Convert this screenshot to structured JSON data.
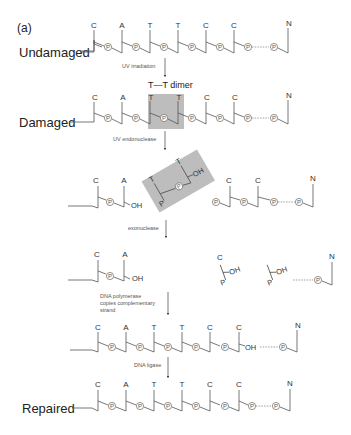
{
  "panel_label": "(a)",
  "rows": {
    "undamaged": {
      "label": "Undamaged",
      "bases": [
        "C",
        "A",
        "T",
        "T",
        "C",
        "C",
        "N"
      ]
    },
    "damaged": {
      "label": "Damaged",
      "bases": [
        "C",
        "A",
        "T",
        "T",
        "C",
        "C",
        "N"
      ],
      "dimer_label": "T—T dimer"
    },
    "incised": {
      "left_bases": [
        "C",
        "A"
      ],
      "excised_bases": [
        "T",
        "T"
      ],
      "right_bases": [
        "C",
        "C",
        "N"
      ]
    },
    "exonuclease": {
      "left_bases": [
        "C",
        "A"
      ],
      "right_bases": [
        "C",
        "N"
      ]
    },
    "polymerase": {
      "bases": [
        "C",
        "A",
        "T",
        "T",
        "C",
        "C",
        "N"
      ]
    },
    "repaired": {
      "label": "Repaired",
      "bases": [
        "C",
        "A",
        "T",
        "T",
        "C",
        "C",
        "N"
      ]
    }
  },
  "steps": {
    "uv_irradiation": "UV irradiation",
    "uv_endonuclease": "UV endonuclease",
    "exonuclease": "exonuclease",
    "polymerase_line1": "DNA polymerase",
    "polymerase_line2": "copies complementary",
    "polymerase_line3": "strand",
    "ligase": "DNA ligase"
  },
  "symbols": {
    "phosphate": "P",
    "hydroxyl": "OH"
  },
  "colors": {
    "shade": "#bdbdbd",
    "line": "#555555"
  }
}
